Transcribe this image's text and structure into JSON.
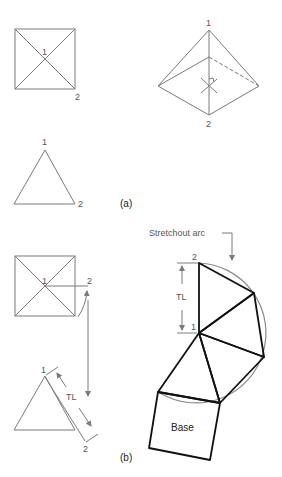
{
  "figure": {
    "panel_a": {
      "caption": "(a)",
      "top_view": {
        "point_labels": [
          "1",
          "2"
        ]
      },
      "pictorial_view": {
        "point_labels": [
          "1",
          "2"
        ]
      },
      "front_view": {
        "point_labels": [
          "1",
          "2"
        ]
      }
    },
    "panel_b": {
      "caption": "(b)",
      "top_view": {
        "point_labels": [
          "1",
          "2"
        ]
      },
      "true_length_view": {
        "point_labels": [
          "1",
          "2"
        ],
        "dimension_label": "TL"
      },
      "development": {
        "callout": "Stretchout arc",
        "point_labels": [
          "2",
          "1"
        ],
        "dimension_label": "TL",
        "base_label": "Base"
      }
    }
  }
}
